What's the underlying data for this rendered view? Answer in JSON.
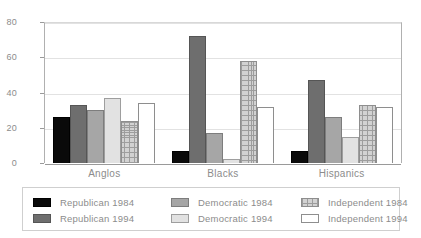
{
  "chart_data": {
    "type": "bar",
    "title": "",
    "subtitle": "",
    "xlabel": "",
    "ylabel": "",
    "categories": [
      "Anglos",
      "Blacks",
      "Hispanics"
    ],
    "ylim": [
      0,
      80
    ],
    "yticks": [
      0,
      20,
      40,
      60,
      80
    ],
    "ytick_labels": [
      "0",
      "20",
      "40",
      "60",
      "80"
    ],
    "grid": true,
    "legend_position": "bottom",
    "series": [
      {
        "name": "Republican 1984",
        "color": "#0a0a0a",
        "values": [
          26,
          7,
          7
        ]
      },
      {
        "name": "Democratic 1984",
        "color": "#a6a6a6",
        "values": [
          33,
          72,
          47
        ]
      },
      {
        "name": "Independent 1984",
        "color": "#e2e2e2",
        "values": [
          30,
          17,
          26
        ]
      },
      {
        "name": "Republican 1994",
        "color": "#6e6e6e",
        "values": [
          37,
          2,
          15
        ]
      },
      {
        "name": "Democratic 1994",
        "color": "#d2d2d2",
        "values": [
          24,
          58,
          33
        ]
      },
      {
        "name": "Independent 1994",
        "color": "#ffffff",
        "values": [
          34,
          32,
          32
        ]
      }
    ]
  },
  "legend": {
    "entries": [
      {
        "label": "Republican 1984",
        "swatch": "black-swatch"
      },
      {
        "label": "Republican 1994",
        "swatch": "dark-gray-swatch"
      },
      {
        "label": "Democratic 1984",
        "swatch": "medium-gray-swatch"
      },
      {
        "label": "Democratic 1994",
        "swatch": "light-gray-swatch"
      },
      {
        "label": "Independent 1984",
        "swatch": "crosshatch-swatch"
      },
      {
        "label": "Independent 1994",
        "swatch": "white-swatch"
      }
    ]
  },
  "axis": {
    "y_max_label": "80",
    "y_min_label": "0"
  }
}
